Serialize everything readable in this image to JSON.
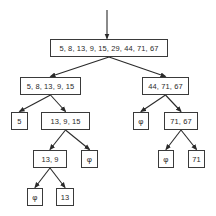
{
  "diagram": {
    "type": "recursive-partition-tree",
    "nodes": [
      {
        "id": "root",
        "label": "5, 8, 13, 9, 15, 29, 44, 71, 67",
        "x": 50,
        "y": 39,
        "w": 118,
        "h": 18
      },
      {
        "id": "l",
        "label": "5, 8, 13, 9, 15",
        "x": 20,
        "y": 77,
        "w": 61,
        "h": 18
      },
      {
        "id": "r",
        "label": "44, 71, 67",
        "x": 142,
        "y": 77,
        "w": 47,
        "h": 18
      },
      {
        "id": "ll",
        "label": "5",
        "x": 11,
        "y": 112,
        "w": 17,
        "h": 18
      },
      {
        "id": "lr",
        "label": "13, 9, 15",
        "x": 41,
        "y": 112,
        "w": 49,
        "h": 18
      },
      {
        "id": "rl",
        "label": "φ",
        "x": 133,
        "y": 112,
        "w": 16,
        "h": 18
      },
      {
        "id": "rr",
        "label": "71, 67",
        "x": 164,
        "y": 112,
        "w": 34,
        "h": 18
      },
      {
        "id": "lrl",
        "label": "13, 9",
        "x": 33,
        "y": 150,
        "w": 34,
        "h": 18
      },
      {
        "id": "lrr",
        "label": "φ",
        "x": 81,
        "y": 150,
        "w": 17,
        "h": 18
      },
      {
        "id": "rrl",
        "label": "φ",
        "x": 158,
        "y": 150,
        "w": 16,
        "h": 18
      },
      {
        "id": "rrr",
        "label": "71",
        "x": 188,
        "y": 150,
        "w": 17,
        "h": 18
      },
      {
        "id": "lrll",
        "label": "φ",
        "x": 27,
        "y": 188,
        "w": 16,
        "h": 18
      },
      {
        "id": "lrlr",
        "label": "13",
        "x": 56,
        "y": 188,
        "w": 18,
        "h": 18
      }
    ],
    "edges": [
      [
        "root",
        "l"
      ],
      [
        "root",
        "r"
      ],
      [
        "l",
        "ll"
      ],
      [
        "l",
        "lr"
      ],
      [
        "r",
        "rl"
      ],
      [
        "r",
        "rr"
      ],
      [
        "lr",
        "lrl"
      ],
      [
        "lr",
        "lrr"
      ],
      [
        "rr",
        "rrl"
      ],
      [
        "rr",
        "rrr"
      ],
      [
        "lrl",
        "lrll"
      ],
      [
        "lrl",
        "lrlr"
      ]
    ],
    "entry_arrow": {
      "x": 107,
      "y1": 10,
      "y2": 39
    },
    "line_color": "#2a2a2a"
  }
}
